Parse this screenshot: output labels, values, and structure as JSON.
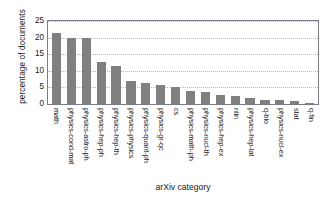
{
  "chart_data": {
    "type": "bar",
    "title": "",
    "xlabel": "arXiv category",
    "ylabel": "percentage of documents",
    "ylim": [
      0,
      25
    ],
    "yticks": [
      0,
      5,
      10,
      15,
      20,
      25
    ],
    "grid": true,
    "legend": null,
    "bar_color": "#808080",
    "categories": [
      "math",
      "physics-cond-mat",
      "physics-astro-ph",
      "physics-hep-ph",
      "physics-hep-th",
      "physics-physics",
      "physics-quant-ph",
      "physics-gr-qc",
      "cs",
      "physics-math-ph",
      "physics-nucl-th",
      "physics-hep-ex",
      "nlin",
      "physics-hep-lat",
      "q-bio",
      "physics-nucl-ex",
      "stat",
      "q-fin"
    ],
    "values": [
      21.5,
      20.0,
      19.9,
      12.7,
      11.4,
      7.0,
      6.2,
      5.8,
      5.2,
      3.9,
      3.6,
      2.7,
      2.5,
      1.9,
      1.2,
      1.1,
      0.8,
      0.3
    ]
  }
}
